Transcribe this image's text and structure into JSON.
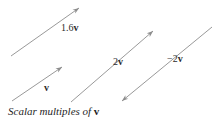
{
  "figure": {
    "width": 217,
    "height": 124,
    "background_color": "#ffffff",
    "line_color": "#8d8d8d",
    "text_color": "#2b2b2b",
    "caption": {
      "text_prefix": "Scalar multiples of ",
      "symbol": "v",
      "full_text": "Scalar multiples of v"
    },
    "vectors": [
      {
        "id": "vector-1-6v",
        "label_prefix": "1.6",
        "label_symbol": "v",
        "label_full": "1.6v",
        "scalar": 1.6,
        "direction": "up-right",
        "arrowheads": "end",
        "start": {
          "x": 11,
          "y": 56
        },
        "end": {
          "x": 79,
          "y": 8
        }
      },
      {
        "id": "vector-v",
        "label_prefix": "",
        "label_symbol": "v",
        "label_full": "v",
        "scalar": 1,
        "direction": "up-right",
        "arrowheads": "end",
        "start": {
          "x": 12,
          "y": 101
        },
        "end": {
          "x": 62,
          "y": 67
        }
      },
      {
        "id": "vector-2v",
        "label_prefix": "2",
        "label_symbol": "v",
        "label_full": "2v",
        "scalar": 2,
        "direction": "up-right",
        "arrowheads": "end",
        "start": {
          "x": 71,
          "y": 102
        },
        "end": {
          "x": 153,
          "y": 31
        }
      },
      {
        "id": "vector-minus-2v",
        "label_prefix": "−2",
        "label_symbol": "v",
        "label_full": "−2v",
        "scalar": -2,
        "direction": "down-left",
        "arrowheads": "start",
        "start": {
          "x": 212,
          "y": 27
        },
        "end": {
          "x": 122,
          "y": 101
        }
      }
    ]
  }
}
